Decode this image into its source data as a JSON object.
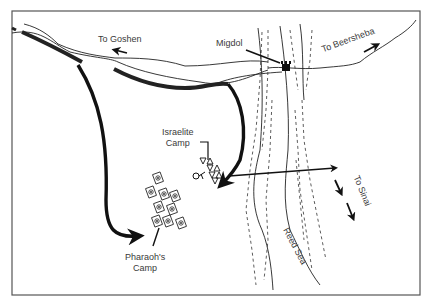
{
  "map": {
    "title": "Crossing of the Reed Sea",
    "colors": {
      "ink": "#111111",
      "label": "#3a3a3a",
      "frame": "#555555",
      "background": "#ffffff"
    },
    "labels": {
      "goshen": "To Goshen",
      "migdol": "Migdol",
      "beersheba": "To Beersheba",
      "israelite_camp_line1": "Israelite",
      "israelite_camp_line2": "Camp",
      "pharaoh_camp_line1": "Pharaoh's",
      "pharaoh_camp_line2": "Camp",
      "sinai": "To Sinai",
      "reed_sea": "Reed Sea"
    },
    "features": [
      {
        "name": "Migdol",
        "type": "fortress",
        "icon": "tower-icon"
      },
      {
        "name": "Israelite Camp",
        "type": "camp",
        "icon": "tent-triangle-icon",
        "count": 7
      },
      {
        "name": "Pharaoh's Camp",
        "type": "camp",
        "icon": "chariot-square-icon",
        "count": 9
      },
      {
        "name": "Reed Sea",
        "type": "water-body"
      }
    ],
    "routes": [
      {
        "name": "Egyptian pursuit",
        "from": "northwest road",
        "to": "Pharaoh's Camp"
      },
      {
        "name": "Israelite march",
        "from": "road",
        "to": "Israelite Camp"
      },
      {
        "name": "Sea crossing",
        "from": "Israelite Camp",
        "to": "east bank"
      },
      {
        "name": "Route to Sinai",
        "direction": "south-east"
      },
      {
        "name": "Route to Goshen",
        "direction": "west"
      },
      {
        "name": "Route to Beersheba",
        "direction": "north-east"
      }
    ]
  }
}
